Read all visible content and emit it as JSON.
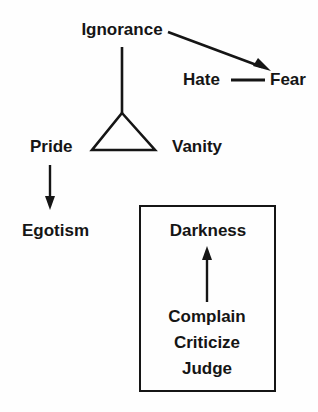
{
  "diagram": {
    "title_present": false,
    "background_color": "#fefefe",
    "ink_color": "#151515",
    "nodes": {
      "ignorance": "Ignorance",
      "hate": "Hate",
      "fear": "Fear",
      "pride": "Pride",
      "vanity": "Vanity",
      "egotism": "Egotism",
      "darkness": "Darkness",
      "complain": "Complain",
      "criticize": "Criticize",
      "judge": "Judge"
    },
    "connectors": [
      {
        "name": "ignorance-to-hate-fear-arrow",
        "from": "Ignorance",
        "to": "Fear",
        "style": "arrow",
        "direction": "diagonal-down-right"
      },
      {
        "name": "ignorance-to-triangle-line",
        "from": "Ignorance",
        "to": "triangle-apex",
        "style": "line",
        "direction": "vertical-down"
      },
      {
        "name": "hate-fear-connector",
        "from": "Hate",
        "to": "Fear",
        "style": "line",
        "direction": "horizontal"
      },
      {
        "name": "pride-to-egotism-arrow",
        "from": "Pride",
        "to": "Egotism",
        "style": "arrow",
        "direction": "vertical-down"
      },
      {
        "name": "complain-to-darkness-arrow",
        "from": "Complain",
        "to": "Darkness",
        "style": "arrow",
        "direction": "vertical-up"
      }
    ],
    "shapes": [
      {
        "name": "triangle",
        "type": "triangle",
        "apex_label_link": "Ignorance",
        "left_label_link": "Pride",
        "right_label_link": "Vanity"
      },
      {
        "name": "darkness-box",
        "type": "rectangle",
        "contains": [
          "Darkness",
          "Complain",
          "Criticize",
          "Judge"
        ]
      }
    ]
  }
}
